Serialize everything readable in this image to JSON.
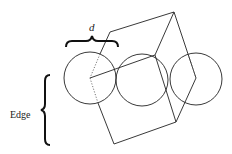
{
  "diagram": {
    "title": "",
    "labels": {
      "d": "d",
      "edge": "Edge"
    },
    "circles": [
      {
        "cx": 90,
        "cy": 78,
        "r": 26
      },
      {
        "cx": 142,
        "cy": 80,
        "r": 26
      },
      {
        "cx": 196,
        "cy": 79,
        "r": 26
      }
    ],
    "cube_vertices": {
      "top": [
        174,
        12
      ],
      "upper_left": [
        110,
        32
      ],
      "middle": [
        155,
        55
      ],
      "left": [
        90,
        78
      ],
      "right": [
        196,
        78
      ],
      "bottom_right": [
        176,
        122
      ],
      "bottom": [
        114,
        144
      ]
    },
    "colors": {
      "stroke": "#222222",
      "background": "#ffffff"
    }
  }
}
